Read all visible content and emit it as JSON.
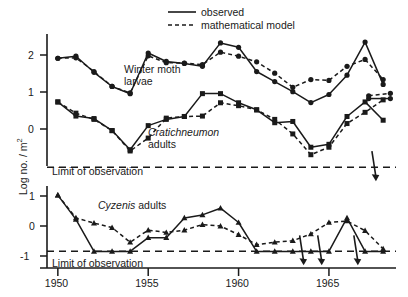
{
  "chart_data": {
    "type": "line",
    "title": "",
    "subtitle": "",
    "xlabel": "",
    "ylabel": "Log no. / m²",
    "xlim": [
      1949.4,
      1968.6
    ],
    "grid": false,
    "legend_position": "top-center",
    "legend": [
      {
        "label": "observed",
        "style": "solid"
      },
      {
        "label": "mathematical model",
        "style": "dashed"
      }
    ],
    "panels": [
      {
        "name": "winter-moth-larvae",
        "label": "Winter moth larvae",
        "label_italic": "",
        "marker": "circle",
        "ylim": [
          -0.35,
          2.75
        ],
        "yticks": [
          2,
          1,
          0
        ],
        "ytick_labels": [
          "2",
          "1",
          "0"
        ],
        "x": [
          1950,
          1951,
          1952,
          1953,
          1954,
          1955,
          1956,
          1957,
          1958,
          1959,
          1960,
          1961,
          1962,
          1963,
          1964,
          1965,
          1966,
          1967,
          1968
        ],
        "series": [
          {
            "name": "observed",
            "style": "solid",
            "values": [
              2.05,
              2.1,
              1.7,
              1.35,
              1.17,
              2.18,
              1.97,
              1.92,
              1.85,
              2.43,
              2.32,
              1.72,
              1.47,
              1.22,
              0.95,
              1.15,
              1.63,
              2.45,
              1.4
            ]
          },
          {
            "name": "mathematical model",
            "style": "dashed",
            "values": [
              2.05,
              2.06,
              1.72,
              1.35,
              1.19,
              2.11,
              1.94,
              1.93,
              1.89,
              2.2,
              2.1,
              1.96,
              1.68,
              1.33,
              1.52,
              1.5,
              1.85,
              2.02,
              1.52
            ]
          }
        ],
        "tail_observed": [
          1.05,
          1.02
        ],
        "tail_model": [
          1.12,
          1.18
        ],
        "limit_line": null,
        "arrows": []
      },
      {
        "name": "cratichneumon-adults",
        "label": "adults",
        "label_italic": "Cratichneumon",
        "marker": "square",
        "ylim": [
          -0.62,
          1.45
        ],
        "yticks": [
          1,
          0
        ],
        "ytick_labels": [
          "1",
          "0"
        ],
        "x": [
          1950,
          1951,
          1952,
          1953,
          1954,
          1955,
          1956,
          1957,
          1958,
          1959,
          1960,
          1961,
          1962,
          1963,
          1964,
          1965,
          1966,
          1967,
          1968
        ],
        "series": [
          {
            "name": "observed",
            "style": "solid",
            "values": [
              0.97,
              0.63,
              0.57,
              0.28,
              -0.18,
              0.4,
              0.55,
              0.62,
              1.17,
              1.17,
              0.95,
              0.78,
              0.47,
              0.5,
              -0.12,
              -0.05,
              0.62,
              0.97,
              0.53
            ]
          },
          {
            "name": "mathematical model",
            "style": "dashed",
            "values": [
              0.97,
              0.7,
              0.55,
              0.28,
              -0.21,
              0.1,
              0.58,
              0.62,
              0.63,
              0.95,
              0.88,
              0.78,
              0.55,
              0.2,
              -0.3,
              -0.12,
              0.45,
              0.72,
              1.02
            ]
          }
        ],
        "limit_line": -0.6,
        "limit_label": "Limit of observation",
        "arrows": [
          {
            "x": 1967.6,
            "note": "below detection"
          }
        ]
      },
      {
        "name": "cyzenis-adults",
        "label": "adults",
        "label_italic": "Cyzenis",
        "marker": "triangle",
        "ylim": [
          -1.35,
          1.15
        ],
        "yticks": [
          1,
          0,
          -1
        ],
        "ytick_labels": [
          "1",
          "0",
          "-1"
        ],
        "x": [
          1950,
          1951,
          1952,
          1953,
          1954,
          1955,
          1956,
          1957,
          1958,
          1959,
          1960,
          1961,
          1962,
          1963,
          1964,
          1965,
          1966,
          1967,
          1968
        ],
        "series": [
          {
            "name": "observed",
            "style": "solid",
            "values": [
              0.85,
              0.05,
              -1.0,
              -1.0,
              -1.0,
              -0.55,
              -0.55,
              0.1,
              0.2,
              0.42,
              -0.05,
              -1.0,
              -1.0,
              -1.0,
              -1.4,
              -1.3,
              0.1,
              -1.4,
              -1.4
            ]
          },
          {
            "name": "mathematical model",
            "style": "dashed",
            "values": [
              0.85,
              0.1,
              -0.07,
              -0.22,
              -0.7,
              -0.3,
              -0.38,
              -0.3,
              -0.12,
              -0.17,
              -0.45,
              -0.78,
              -0.7,
              -0.65,
              -0.43,
              -0.05,
              0.0,
              -0.32,
              -0.92
            ]
          }
        ],
        "limit_line": -1.0,
        "limit_label": "Limit of observation",
        "arrows": [
          {
            "x": 1963.6,
            "note": "below detection"
          },
          {
            "x": 1964.6,
            "note": "below detection"
          },
          {
            "x": 1966.6,
            "note": "below detection"
          }
        ]
      }
    ],
    "xticks": [
      1950,
      1955,
      1960,
      1965
    ],
    "xtick_labels": [
      "1950",
      "1955",
      "1960",
      "1965"
    ]
  },
  "colors": {
    "ink": "#1a1a1a",
    "background": "#ffffff"
  }
}
